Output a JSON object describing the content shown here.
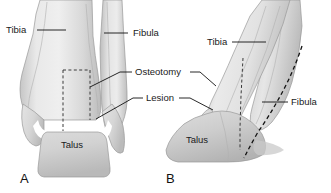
{
  "figure": {
    "background_color": "#ffffff",
    "width": 331,
    "height": 193,
    "bone_fill_light": "#e3e3e3",
    "bone_fill_mid": "#cfcfcf",
    "bone_fill_shadow": "#b4b4b4",
    "outline_color": "#9a9a9a",
    "line_color": "#111111"
  },
  "panels": [
    {
      "id": "panel-a",
      "letter": "A",
      "view": "anteroposterior",
      "letter_position": {
        "x": 20,
        "y": 183
      }
    },
    {
      "id": "panel-b",
      "letter": "B",
      "view": "lateral",
      "letter_position": {
        "x": 166,
        "y": 183
      }
    }
  ],
  "labels": [
    {
      "id": "label-tibia-a",
      "text": "Tibia",
      "panel": "A",
      "anchor": "start",
      "position": {
        "x": 6,
        "y": 33
      },
      "leader": "M 37 30 L 66 30"
    },
    {
      "id": "label-fibula-a",
      "text": "Fibula",
      "panel": "A",
      "anchor": "start",
      "position": {
        "x": 133,
        "y": 36
      },
      "leader": "M 128 33 L 104 33"
    },
    {
      "id": "label-osteotomy",
      "text": "Osteotomy",
      "panel": "both",
      "anchor": "start",
      "position": {
        "x": 135,
        "y": 75
      },
      "leader_left": "M 132 72 L 120 72 L 90 87",
      "leader_right": "M 190 72 L 200 72 L 216 86"
    },
    {
      "id": "label-lesion",
      "text": "Lesion",
      "panel": "both",
      "anchor": "start",
      "position": {
        "x": 146,
        "y": 101
      },
      "leader_left": "M 143 98 L 133 98 L 96 119",
      "leader_right": "M 179 98 L 190 98 L 213 110"
    },
    {
      "id": "label-tibia-b",
      "text": "Tibia",
      "panel": "B",
      "anchor": "start",
      "position": {
        "x": 207,
        "y": 45
      },
      "leader": "M 232 42 L 266 42"
    },
    {
      "id": "label-fibula-b",
      "text": "Fibula",
      "panel": "B",
      "anchor": "start",
      "position": {
        "x": 291,
        "y": 105
      },
      "leader": "M 288 102 L 262 102"
    },
    {
      "id": "label-talus-a",
      "text": "Talus",
      "panel": "A",
      "anchor": "middle",
      "position": {
        "x": 72,
        "y": 148
      }
    },
    {
      "id": "label-talus-b",
      "text": "Talus",
      "panel": "B",
      "anchor": "middle",
      "position": {
        "x": 197,
        "y": 143
      }
    }
  ],
  "annotations": {
    "osteotomy_dashed_a": "rectangular dashed osteotomy outline on distal tibia, anteroposterior view",
    "osteotomy_dashed_b": "vertical dashed osteotomy line on distal tibia, lateral view",
    "fibula_dashed_b": "curved dashed line along posterior fibula, lateral view"
  }
}
